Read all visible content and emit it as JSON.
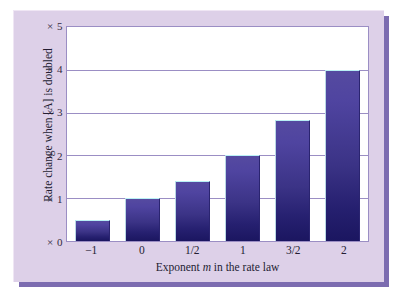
{
  "figure": {
    "panel_bg": "#ddd0e8",
    "panel_shadow": "#7c6cb0",
    "plot_bg": "#ffffff",
    "grid_color": "#9b8ec4",
    "bar_color_top": "#554aa0",
    "bar_color_bottom": "#1b1660"
  },
  "axis_titles": {
    "y": "Rate change when [A] is doubled",
    "x_prefix": "Exponent ",
    "x_variable": "m",
    "x_suffix": " in the rate law"
  },
  "chart_data": {
    "type": "bar",
    "title": "",
    "xlabel": "Exponent m in the rate law",
    "ylabel": "Rate change when [A] is doubled",
    "categories": [
      "−1",
      "0",
      "1/2",
      "1",
      "3/2",
      "2"
    ],
    "values": [
      0.5,
      1.0,
      1.41,
      2.0,
      2.83,
      4.0
    ],
    "ylim": [
      0,
      5
    ],
    "ytick_labels": [
      "× 0",
      "× 1",
      "× 2",
      "× 3",
      "× 4",
      "× 5"
    ],
    "ytick_values": [
      0,
      1,
      2,
      3,
      4,
      5
    ],
    "grid": true,
    "legend": "none",
    "note": "Bar heights follow 2^m : rate multiplier when [A] is doubled for reaction order m"
  }
}
